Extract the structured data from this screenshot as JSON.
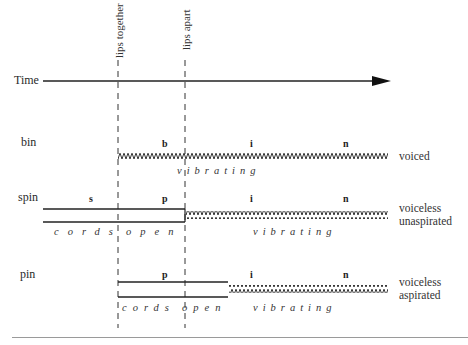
{
  "markers": {
    "lips_together": "lips together",
    "lips_apart": "lips apart"
  },
  "time_axis": {
    "label": "Time"
  },
  "rows": [
    {
      "word": "bin",
      "segments": [
        "b",
        "i",
        "n"
      ],
      "states": [
        "vibrating"
      ],
      "description": [
        "voiced"
      ]
    },
    {
      "word": "spin",
      "segments": [
        "s",
        "p",
        "i",
        "n"
      ],
      "states": [
        "cords",
        "open",
        "vibrating"
      ],
      "description": [
        "voiceless",
        "unaspirated"
      ]
    },
    {
      "word": "pin",
      "segments": [
        "p",
        "i",
        "n"
      ],
      "states": [
        "cords",
        "open",
        "vibrating"
      ],
      "description": [
        "voiceless",
        "aspirated"
      ]
    }
  ],
  "colors": {
    "ink": "#222222",
    "rule": "#9a9a9a"
  }
}
